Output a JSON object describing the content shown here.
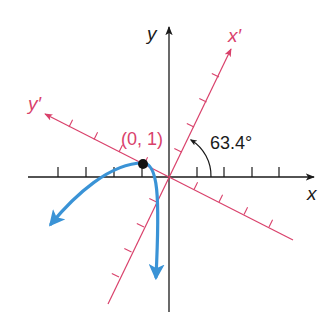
{
  "diagram": {
    "type": "rotated-axes-parabola",
    "colors": {
      "axes": "#1a1a1a",
      "rotated_axes": "#d9416b",
      "curve": "#3a93d6",
      "point": "#111111",
      "background": "#ffffff"
    },
    "labels": {
      "x_axis": "x",
      "y_axis": "y",
      "x_prime_axis": "x′",
      "y_prime_axis": "y′",
      "point": "(0, 1)",
      "angle": "63.4°"
    },
    "rotation_angle_deg": 63.4,
    "point": {
      "x_prime": 0,
      "y_prime": 1
    },
    "ticks_per_side": 4
  }
}
